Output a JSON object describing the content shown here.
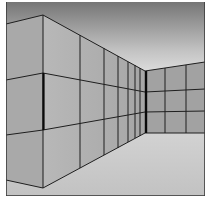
{
  "image": {
    "description": "Perspective illustration of a tiled hallway corner: left wall, receding right wall, far wall, gradient ceiling and gray floor",
    "frame": {
      "x": 6,
      "y": 2,
      "width": 199,
      "height": 194
    },
    "colors": {
      "ceiling_top": "#7a7a7a",
      "ceiling_bottom": "#f2f2f2",
      "wall_left": "#a8a8a8",
      "wall_receding": "#b4b4b4",
      "wall_far": "#a0a0a0",
      "floor": "#c8c8c8",
      "grout": "#1e1e1e",
      "border": "#3a3a3a",
      "background": "#ffffff"
    }
  }
}
